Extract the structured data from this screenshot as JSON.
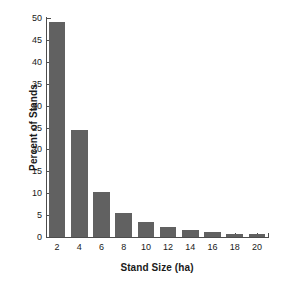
{
  "chart_data": {
    "type": "bar",
    "title": "",
    "xlabel": "Stand Size (ha)",
    "ylabel": "Percent of Stands",
    "categories": [
      "2",
      "4",
      "6",
      "8",
      "10",
      "12",
      "14",
      "16",
      "18",
      "20"
    ],
    "values": [
      49.2,
      24.4,
      10.3,
      5.5,
      3.4,
      2.3,
      1.6,
      1.2,
      0.8,
      0.6
    ],
    "ylim": [
      0,
      50
    ],
    "yticks": [
      "0",
      "5",
      "10",
      "15",
      "20",
      "25",
      "30",
      "35",
      "40",
      "45",
      "50"
    ],
    "ytick_values": [
      0,
      5,
      10,
      15,
      20,
      25,
      30,
      35,
      40,
      45,
      50
    ],
    "grid": false,
    "legend": null,
    "bar_color": "#616161",
    "axis_color": "#4d4d4d",
    "background": "#ffffff"
  }
}
